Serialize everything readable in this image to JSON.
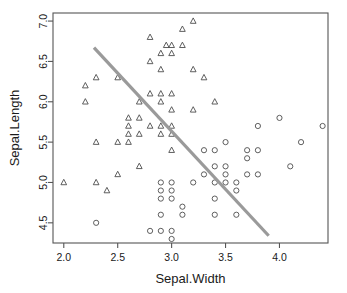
{
  "chart_data": {
    "type": "scatter",
    "title": "",
    "xlabel": "Sepal.Width",
    "ylabel": "Sepal.Length",
    "xlim": [
      1.9,
      4.45
    ],
    "ylim": [
      4.25,
      7.1
    ],
    "xticks": [
      2.0,
      2.5,
      3.0,
      3.5,
      4.0
    ],
    "xtick_labels": [
      "2.0",
      "2.5",
      "3.0",
      "3.5",
      "4.0"
    ],
    "yticks": [
      4.5,
      5.0,
      5.5,
      6.0,
      6.5,
      7.0
    ],
    "ytick_labels": [
      "4.5",
      "5.0",
      "5.5",
      "6.0",
      "6.5",
      "7.0"
    ],
    "grid": false,
    "legend": "none",
    "box": true,
    "series": [
      {
        "name": "group-triangle",
        "marker": "triangle",
        "color": "#4d4d4d",
        "points": [
          [
            2.0,
            5.0
          ],
          [
            2.2,
            6.2
          ],
          [
            2.2,
            6.0
          ],
          [
            2.3,
            6.3
          ],
          [
            2.3,
            5.5
          ],
          [
            2.3,
            5.0
          ],
          [
            2.4,
            4.9
          ],
          [
            2.5,
            6.3
          ],
          [
            2.5,
            5.5
          ],
          [
            2.5,
            5.1
          ],
          [
            2.6,
            5.8
          ],
          [
            2.6,
            5.7
          ],
          [
            2.6,
            5.6
          ],
          [
            2.6,
            5.5
          ],
          [
            2.7,
            6.0
          ],
          [
            2.7,
            5.8
          ],
          [
            2.7,
            5.6
          ],
          [
            2.7,
            5.2
          ],
          [
            2.8,
            6.8
          ],
          [
            2.8,
            6.5
          ],
          [
            2.8,
            6.1
          ],
          [
            2.8,
            5.7
          ],
          [
            2.9,
            6.6
          ],
          [
            2.9,
            6.4
          ],
          [
            2.9,
            6.1
          ],
          [
            2.9,
            6.0
          ],
          [
            2.9,
            5.7
          ],
          [
            2.9,
            5.6
          ],
          [
            3.0,
            6.7
          ],
          [
            2.95,
            6.7
          ],
          [
            3.0,
            6.6
          ],
          [
            3.0,
            6.1
          ],
          [
            3.0,
            5.9
          ],
          [
            3.0,
            5.7
          ],
          [
            3.0,
            5.6
          ],
          [
            3.0,
            5.4
          ],
          [
            3.1,
            6.9
          ],
          [
            3.1,
            6.7
          ],
          [
            3.2,
            7.0
          ],
          [
            3.2,
            6.4
          ],
          [
            3.2,
            5.9
          ],
          [
            3.3,
            6.3
          ],
          [
            3.4,
            6.0
          ]
        ]
      },
      {
        "name": "group-circle",
        "marker": "circle",
        "color": "#4d4d4d",
        "points": [
          [
            2.3,
            4.5
          ],
          [
            2.8,
            4.4
          ],
          [
            2.9,
            5.0
          ],
          [
            2.9,
            4.9
          ],
          [
            2.9,
            4.8
          ],
          [
            2.9,
            4.6
          ],
          [
            2.9,
            4.4
          ],
          [
            3.0,
            5.0
          ],
          [
            3.0,
            4.9
          ],
          [
            3.0,
            4.8
          ],
          [
            3.0,
            4.4
          ],
          [
            3.0,
            4.3
          ],
          [
            3.1,
            4.7
          ],
          [
            3.1,
            4.6
          ],
          [
            3.2,
            5.0
          ],
          [
            3.3,
            5.1
          ],
          [
            3.3,
            5.4
          ],
          [
            3.4,
            5.4
          ],
          [
            3.4,
            5.2
          ],
          [
            3.4,
            5.0
          ],
          [
            3.4,
            4.8
          ],
          [
            3.4,
            4.6
          ],
          [
            3.5,
            5.5
          ],
          [
            3.5,
            5.2
          ],
          [
            3.5,
            5.1
          ],
          [
            3.5,
            5.0
          ],
          [
            3.6,
            5.0
          ],
          [
            3.6,
            4.9
          ],
          [
            3.6,
            4.6
          ],
          [
            3.7,
            5.4
          ],
          [
            3.7,
            5.3
          ],
          [
            3.7,
            5.1
          ],
          [
            3.8,
            5.7
          ],
          [
            3.8,
            5.4
          ],
          [
            3.8,
            5.1
          ],
          [
            4.0,
            5.8
          ],
          [
            4.1,
            5.2
          ],
          [
            4.2,
            5.5
          ],
          [
            4.4,
            5.7
          ]
        ]
      }
    ],
    "trend_line": {
      "name": "regression-line",
      "color": "#9a9a9a",
      "x_start": 2.28,
      "y_start": 6.67,
      "x_end": 3.9,
      "y_end": 4.34
    }
  }
}
